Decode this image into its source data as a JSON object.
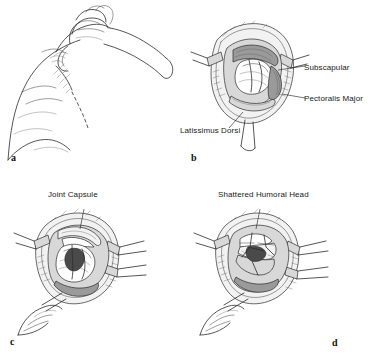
{
  "figure": {
    "background": "#ffffff",
    "ink_color": "#2b2b2b"
  },
  "panels": [
    {
      "id": "a",
      "letter": "a",
      "title": "",
      "labels": []
    },
    {
      "id": "b",
      "letter": "b",
      "title": "",
      "labels": [
        {
          "text": "Subscapular",
          "name": "label-subscapular"
        },
        {
          "text": "Pectoralis Major",
          "name": "label-pectoralis-major"
        },
        {
          "text": "Latissimus Dorsi",
          "name": "label-latissimus-dorsi"
        }
      ]
    },
    {
      "id": "c",
      "letter": "c",
      "title": "Joint Capsule",
      "labels": [
        {
          "text": "Joint Capsule",
          "name": "label-joint-capsule"
        }
      ]
    },
    {
      "id": "d",
      "letter": "d",
      "title": "Shattered Humoral Head",
      "labels": [
        {
          "text": "Shattered Humoral Head",
          "name": "label-shattered-humoral-head"
        }
      ]
    }
  ]
}
